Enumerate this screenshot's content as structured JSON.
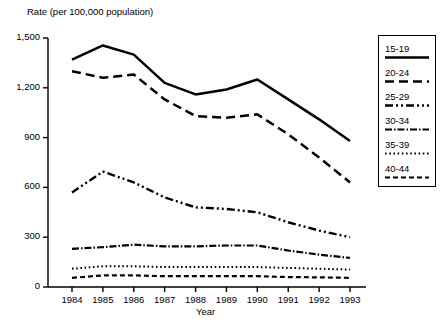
{
  "chart_data": {
    "type": "line",
    "title": "",
    "ylabel": "Rate (per 100,000 population)",
    "xlabel": "Year",
    "x": [
      1984,
      1985,
      1986,
      1987,
      1988,
      1989,
      1990,
      1991,
      1992,
      1993
    ],
    "categories": [
      "1984",
      "1985",
      "1986",
      "1987",
      "1988",
      "1989",
      "1990",
      "1991",
      "1992",
      "1993"
    ],
    "ylim": [
      0,
      1500
    ],
    "yticks": [
      0,
      300,
      600,
      900,
      1200,
      1500
    ],
    "ytick_labels": [
      "0",
      "300",
      "600",
      "900",
      "1,200",
      "1,500"
    ],
    "grid": false,
    "legend_position": "right",
    "series": [
      {
        "name": "15-19",
        "style": "solid",
        "values": [
          1370,
          1455,
          1400,
          1230,
          1160,
          1190,
          1250,
          1130,
          1010,
          880
        ]
      },
      {
        "name": "20-24",
        "style": "dashed",
        "values": [
          1300,
          1260,
          1280,
          1130,
          1030,
          1020,
          1040,
          920,
          780,
          630
        ]
      },
      {
        "name": "25-29",
        "style": "dash-dot-dot",
        "values": [
          570,
          695,
          630,
          540,
          480,
          470,
          450,
          390,
          340,
          300
        ]
      },
      {
        "name": "30-34",
        "style": "dash-dot",
        "values": [
          230,
          240,
          255,
          245,
          245,
          250,
          250,
          220,
          195,
          175
        ]
      },
      {
        "name": "35-39",
        "style": "dotted",
        "values": [
          110,
          125,
          125,
          120,
          120,
          120,
          120,
          115,
          110,
          105
        ]
      },
      {
        "name": "40-44",
        "style": "dashed-short",
        "values": [
          55,
          70,
          70,
          65,
          65,
          65,
          65,
          60,
          58,
          55
        ]
      }
    ]
  },
  "legend": {
    "items": [
      {
        "label": "15-19"
      },
      {
        "label": "20-24"
      },
      {
        "label": "25-29"
      },
      {
        "label": "30-34"
      },
      {
        "label": "35-39"
      },
      {
        "label": "40-44"
      }
    ]
  }
}
